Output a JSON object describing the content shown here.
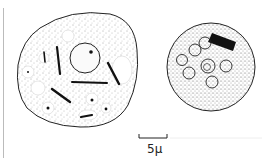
{
  "figure": {
    "scale_bar": {
      "label": "5μ"
    },
    "cells": [
      {
        "name": "left-cell",
        "description": "irregular cell with vacuoles and rod-shaped inclusions"
      },
      {
        "name": "right-cell",
        "description": "round stippled cell with small circular vesicles and dark rod cluster"
      }
    ]
  }
}
